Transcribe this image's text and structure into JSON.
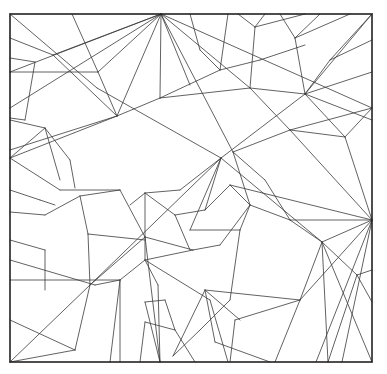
{
  "diagram": {
    "type": "crease-pattern",
    "colors": {
      "line": "#3a3a3a",
      "border": "#222222",
      "background": "#ffffff"
    },
    "border": {
      "x": 10,
      "y": 14,
      "w": 362,
      "h": 348
    },
    "segments": [
      [
        10,
        14,
        97,
        88
      ],
      [
        97,
        88,
        221,
        158
      ],
      [
        221,
        158,
        322,
        242
      ],
      [
        322,
        242,
        372,
        362
      ],
      [
        10,
        362,
        90,
        285
      ],
      [
        90,
        285,
        221,
        158
      ],
      [
        221,
        158,
        305,
        94
      ],
      [
        305,
        94,
        372,
        14
      ],
      [
        161,
        14,
        10,
        72
      ],
      [
        161,
        14,
        10,
        108
      ],
      [
        161,
        14,
        53,
        55
      ],
      [
        161,
        14,
        98,
        72
      ],
      [
        161,
        14,
        117,
        116
      ],
      [
        161,
        14,
        160,
        98
      ],
      [
        161,
        14,
        190,
        85
      ],
      [
        161,
        14,
        233,
        152
      ],
      [
        161,
        14,
        250,
        88
      ],
      [
        161,
        14,
        372,
        108
      ],
      [
        10,
        38,
        53,
        55
      ],
      [
        53,
        55,
        117,
        116
      ],
      [
        117,
        116,
        160,
        98
      ],
      [
        160,
        98,
        250,
        88
      ],
      [
        250,
        88,
        305,
        94
      ],
      [
        72,
        14,
        98,
        72
      ],
      [
        98,
        72,
        117,
        116
      ],
      [
        98,
        72,
        10,
        72
      ],
      [
        10,
        58,
        35,
        62
      ],
      [
        35,
        62,
        25,
        120
      ],
      [
        25,
        120,
        10,
        118
      ],
      [
        10,
        158,
        117,
        116
      ],
      [
        117,
        116,
        10,
        150
      ],
      [
        10,
        158,
        45,
        128
      ],
      [
        45,
        128,
        60,
        180
      ],
      [
        10,
        158,
        60,
        190
      ],
      [
        60,
        190,
        120,
        190
      ],
      [
        10,
        120,
        45,
        128
      ],
      [
        45,
        128,
        70,
        160
      ],
      [
        70,
        160,
        75,
        188
      ],
      [
        160,
        98,
        220,
        70
      ],
      [
        220,
        70,
        260,
        60
      ],
      [
        260,
        60,
        305,
        45
      ],
      [
        190,
        14,
        200,
        50
      ],
      [
        200,
        50,
        220,
        70
      ],
      [
        220,
        70,
        228,
        14
      ],
      [
        238,
        14,
        255,
        27
      ],
      [
        255,
        27,
        265,
        14
      ],
      [
        255,
        27,
        305,
        14
      ],
      [
        255,
        27,
        250,
        88
      ],
      [
        280,
        14,
        295,
        38
      ],
      [
        295,
        38,
        320,
        14
      ],
      [
        295,
        38,
        350,
        14
      ],
      [
        295,
        38,
        305,
        94
      ],
      [
        305,
        94,
        372,
        72
      ],
      [
        305,
        94,
        330,
        60
      ],
      [
        330,
        60,
        372,
        14
      ],
      [
        330,
        60,
        372,
        40
      ],
      [
        305,
        94,
        372,
        120
      ],
      [
        305,
        94,
        345,
        137
      ],
      [
        345,
        137,
        372,
        108
      ],
      [
        250,
        88,
        290,
        130
      ],
      [
        290,
        130,
        372,
        108
      ],
      [
        290,
        130,
        345,
        137
      ],
      [
        233,
        152,
        290,
        130
      ],
      [
        233,
        152,
        250,
        205
      ],
      [
        250,
        205,
        290,
        220
      ],
      [
        290,
        220,
        372,
        220
      ],
      [
        290,
        220,
        322,
        242
      ],
      [
        290,
        220,
        265,
        180
      ],
      [
        265,
        180,
        233,
        152
      ],
      [
        372,
        220,
        322,
        242
      ],
      [
        372,
        220,
        290,
        130
      ],
      [
        372,
        220,
        345,
        137
      ],
      [
        372,
        220,
        230,
        185
      ],
      [
        372,
        220,
        300,
        300
      ],
      [
        300,
        300,
        275,
        362
      ],
      [
        372,
        220,
        342,
        362
      ],
      [
        372,
        220,
        316,
        362
      ],
      [
        322,
        242,
        357,
        275
      ],
      [
        357,
        275,
        372,
        270
      ],
      [
        357,
        275,
        372,
        302
      ],
      [
        322,
        242,
        300,
        300
      ],
      [
        300,
        300,
        235,
        320
      ],
      [
        235,
        320,
        230,
        362
      ],
      [
        322,
        242,
        328,
        362
      ],
      [
        328,
        362,
        357,
        275
      ],
      [
        221,
        158,
        205,
        210
      ],
      [
        205,
        210,
        230,
        185
      ],
      [
        230,
        185,
        250,
        205
      ],
      [
        221,
        158,
        180,
        190
      ],
      [
        180,
        190,
        145,
        193
      ],
      [
        145,
        193,
        130,
        205
      ],
      [
        145,
        193,
        145,
        260
      ],
      [
        145,
        260,
        193,
        250
      ],
      [
        193,
        250,
        220,
        245
      ],
      [
        220,
        245,
        250,
        205
      ],
      [
        145,
        193,
        175,
        215
      ],
      [
        175,
        215,
        205,
        210
      ],
      [
        175,
        215,
        190,
        250
      ],
      [
        190,
        230,
        221,
        158
      ],
      [
        190,
        230,
        240,
        230
      ],
      [
        240,
        230,
        250,
        205
      ],
      [
        240,
        230,
        230,
        300
      ],
      [
        230,
        300,
        200,
        330
      ],
      [
        200,
        330,
        173,
        356
      ],
      [
        205,
        290,
        300,
        300
      ],
      [
        205,
        290,
        215,
        342
      ],
      [
        215,
        342,
        270,
        362
      ],
      [
        205,
        290,
        173,
        356
      ],
      [
        205,
        290,
        240,
        320
      ],
      [
        145,
        260,
        120,
        280
      ],
      [
        120,
        280,
        10,
        280
      ],
      [
        120,
        280,
        95,
        285
      ],
      [
        95,
        285,
        10,
        260
      ],
      [
        145,
        260,
        158,
        285
      ],
      [
        158,
        285,
        160,
        362
      ],
      [
        120,
        280,
        120,
        362
      ],
      [
        120,
        280,
        110,
        362
      ],
      [
        145,
        260,
        210,
        300
      ],
      [
        210,
        300,
        228,
        362
      ],
      [
        10,
        362,
        75,
        350
      ],
      [
        75,
        350,
        90,
        285
      ],
      [
        75,
        350,
        10,
        320
      ],
      [
        88,
        234,
        145,
        240
      ],
      [
        88,
        234,
        90,
        285
      ],
      [
        88,
        234,
        80,
        196
      ],
      [
        80,
        196,
        120,
        190
      ],
      [
        80,
        196,
        45,
        215
      ],
      [
        45,
        215,
        10,
        212
      ],
      [
        10,
        240,
        45,
        250
      ],
      [
        45,
        250,
        45,
        290
      ],
      [
        90,
        285,
        145,
        237
      ],
      [
        145,
        237,
        193,
        250
      ],
      [
        120,
        190,
        145,
        237
      ],
      [
        145,
        237,
        160,
        362
      ],
      [
        145,
        302,
        160,
        362
      ],
      [
        145,
        302,
        165,
        300
      ],
      [
        165,
        300,
        175,
        330
      ],
      [
        175,
        330,
        195,
        362
      ],
      [
        175,
        330,
        145,
        322
      ],
      [
        145,
        322,
        140,
        362
      ],
      [
        10,
        190,
        40,
        200
      ],
      [
        40,
        200,
        55,
        205
      ]
    ]
  }
}
